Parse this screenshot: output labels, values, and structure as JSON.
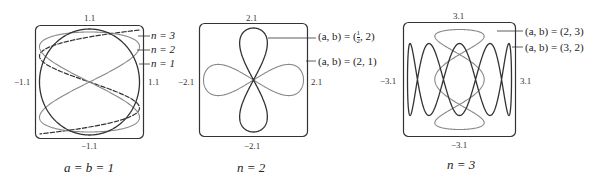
{
  "chart_data": [
    {
      "type": "line",
      "caption": "a = b = 1",
      "xlim": [
        -1.1,
        1.1
      ],
      "ylim": [
        -1.1,
        1.1
      ],
      "ticks": {
        "top": "1.1",
        "bottom": "−1.1",
        "left": "−1.1",
        "right": "1.1"
      },
      "series": [
        {
          "name": "n = 3",
          "style": "dashed",
          "color": "#333333",
          "x": "sin(t)",
          "y": "cos(3t)"
        },
        {
          "name": "n = 2",
          "style": "solid",
          "color": "#888888",
          "x": "sin(t)",
          "y": "cos(2t)"
        },
        {
          "name": "n = 1",
          "style": "solid",
          "color": "#333333",
          "x": "sin(t)",
          "y": "cos(t)"
        }
      ]
    },
    {
      "type": "line",
      "caption": "n = 2",
      "xlim": [
        -2.1,
        2.1
      ],
      "ylim": [
        -2.1,
        2.1
      ],
      "ticks": {
        "top": "2.1",
        "bottom": "−2.1",
        "left": "−2.1",
        "right": "2.1"
      },
      "series": [
        {
          "name": "(a, b) = (1/2, 2)",
          "style": "solid",
          "color": "#333333"
        },
        {
          "name": "(a, b) = (2, 1)",
          "style": "solid",
          "color": "#888888"
        }
      ]
    },
    {
      "type": "line",
      "caption": "n = 3",
      "xlim": [
        -3.1,
        3.1
      ],
      "ylim": [
        -3.1,
        3.1
      ],
      "ticks": {
        "top": "3.1",
        "bottom": "−3.1",
        "left": "−3.1",
        "right": "3.1"
      },
      "series": [
        {
          "name": "(a, b) = (2, 3)",
          "style": "solid",
          "color": "#888888"
        },
        {
          "name": "(a, b) = (3, 2)",
          "style": "solid",
          "color": "#333333"
        }
      ]
    }
  ],
  "panel1": {
    "tick_top": "1.1",
    "tick_bottom": "−1.1",
    "tick_left": "−1.1",
    "tick_right": "1.1",
    "label_n3": "n = 3",
    "label_n2": "n = 2",
    "label_n1": "n = 1",
    "caption": "a = b = 1"
  },
  "panel2": {
    "tick_top": "2.1",
    "tick_bottom": "−2.1",
    "tick_left": "−2.1",
    "tick_right": "2.1",
    "label_1_prefix": "(a, b) = (",
    "label_1_num": "1",
    "label_1_den": "2",
    "label_1_suffix": ", 2)",
    "label_2": "(a, b) = (2, 1)",
    "caption": "n = 2"
  },
  "panel3": {
    "tick_top": "3.1",
    "tick_bottom": "−3.1",
    "tick_left": "−3.1",
    "tick_right": "3.1",
    "label_1": "(a, b) = (2, 3)",
    "label_2": "(a, b) = (3, 2)",
    "caption": "n = 3"
  }
}
